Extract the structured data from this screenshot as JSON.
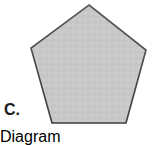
{
  "canvas": {
    "width": 157,
    "height": 128,
    "background_color": "#ffffff"
  },
  "figure": {
    "label": "C.",
    "label_color": "#1c1c1c",
    "shape_name": "pentagon",
    "shape_description": "regular pentagon, point-up, solid light gray fill with dark outline",
    "fill_color": "#c8c8c8",
    "stroke_color": "#4a4a4a",
    "stroke_width": 1.6,
    "sides": 5,
    "vertices": [
      {
        "name": "apex",
        "x": 89,
        "y": 5
      },
      {
        "name": "right-upper",
        "x": 146,
        "y": 50
      },
      {
        "name": "right-lower",
        "x": 126,
        "y": 123
      },
      {
        "name": "left-lower",
        "x": 52,
        "y": 123
      },
      {
        "name": "left-upper",
        "x": 31,
        "y": 48
      }
    ],
    "polygon_points": "89,5 146,50 126,123 52,123 31,48"
  },
  "texture": {
    "noise_color_light": "#d2d2d2",
    "noise_color_dark": "#bfbfbf",
    "noise_opacity": 0.55
  }
}
